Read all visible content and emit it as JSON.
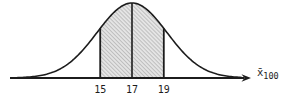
{
  "figure": {
    "background": "#ffffff",
    "ink_color": "#1c1c1c",
    "hatch_fill": "#e4e4e4",
    "hatch_line_color": "#9b9b9b"
  },
  "chart_data": {
    "type": "area",
    "curve": "normal-distribution-bell-curve",
    "title": "",
    "xlabel": "x̄₁₀₀",
    "xlabel_base": "x̄",
    "xlabel_subscript": "100",
    "ylabel": "",
    "x_ticks": [
      "15",
      "17",
      "19"
    ],
    "x_tick_values": [
      15,
      17,
      19
    ],
    "mean": 17,
    "center_line_at": 17,
    "shaded_region": [
      15,
      19
    ],
    "shaded_region_style": "diagonal-hatch",
    "visual_sigma_units": 2.2,
    "grid": false,
    "legend": "none"
  }
}
